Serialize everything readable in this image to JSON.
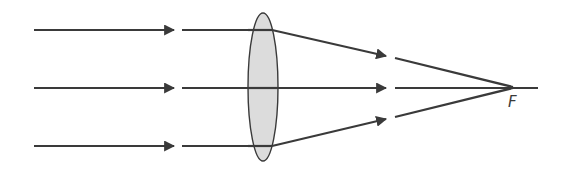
{
  "diagram": {
    "colors": {
      "ray": "#3a3a3a",
      "lens_fill": "#dcdcdc",
      "background": "#ffffff"
    },
    "lens": {
      "type": "convex",
      "label": ""
    },
    "rays": [
      {
        "name": "top-ray",
        "incoming_y": 30,
        "direction": "converging"
      },
      {
        "name": "middle-ray",
        "incoming_y": 88,
        "direction": "axial"
      },
      {
        "name": "bottom-ray",
        "incoming_y": 146,
        "direction": "converging"
      }
    ],
    "focal_point": {
      "label": "F"
    }
  }
}
